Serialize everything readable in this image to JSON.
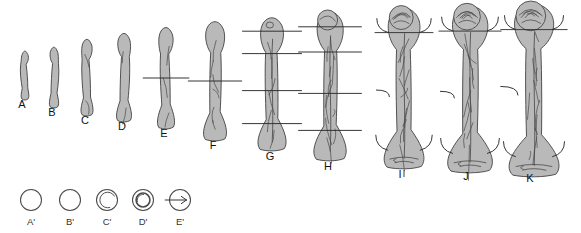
{
  "figure": {
    "background_color": "#ffffff",
    "bone_fill": "#b9b9b9",
    "bone_stroke": "#4a4a4a",
    "marker_stroke": "#2b2b2b",
    "label_color": "#111111"
  },
  "top_row": {
    "name": "maturation-series",
    "stages": [
      {
        "id": "A",
        "label": "A",
        "cx": 25,
        "label_x": 22,
        "label_y": 108,
        "top": 52,
        "bottom": 99,
        "width": 9,
        "features": "slender straight diaphysis, no markers",
        "markers": 0,
        "epiphysis": "none",
        "vascular": "none"
      },
      {
        "id": "B",
        "label": "B",
        "cx": 54,
        "label_x": 52,
        "label_y": 116,
        "top": 48,
        "bottom": 107,
        "width": 10,
        "features": "slightly longer straight shaft",
        "markers": 0,
        "epiphysis": "none",
        "vascular": "none"
      },
      {
        "id": "C",
        "label": "C",
        "cx": 87,
        "label_x": 85,
        "label_y": 124,
        "top": 40,
        "bottom": 115,
        "width": 12,
        "features": "flaring metaphyses, faint mid-shaft cortical lines",
        "markers": 0,
        "epiphysis": "none",
        "vascular": "faint"
      },
      {
        "id": "D",
        "label": "D",
        "cx": 124,
        "label_x": 122,
        "label_y": 130,
        "top": 34,
        "bottom": 121,
        "width": 14,
        "features": "broader flared ends, mid-shaft cortical outline",
        "markers": 0,
        "epiphysis": "none",
        "vascular": "faint"
      },
      {
        "id": "E",
        "label": "E",
        "cx": 166,
        "label_x": 164,
        "label_y": 137,
        "top": 28,
        "bottom": 128,
        "width": 15,
        "features": "single mid-shaft transverse marker",
        "markers": 1,
        "epiphysis": "none",
        "vascular": "light"
      },
      {
        "id": "F",
        "label": "F",
        "cx": 215,
        "label_x": 213,
        "label_y": 149,
        "top": 22,
        "bottom": 140,
        "width": 19,
        "features": "expanded distal end, mid-shaft marker",
        "markers": 1,
        "epiphysis": "none",
        "vascular": "moderate"
      },
      {
        "id": "G",
        "label": "G",
        "cx": 272,
        "label_x": 270,
        "label_y": 160,
        "top": 18,
        "bottom": 150,
        "width": 22,
        "features": "four transverse markers, trabecular lines",
        "markers": 4,
        "epiphysis": "forming",
        "vascular": "moderate"
      },
      {
        "id": "H",
        "label": "H",
        "cx": 330,
        "label_x": 328,
        "label_y": 170,
        "top": 12,
        "bottom": 160,
        "width": 24,
        "features": "rounded proximal epiphyseal centre, four markers",
        "markers": 4,
        "epiphysis": "ossifying-head",
        "vascular": "dense"
      },
      {
        "id": "I",
        "label": "I",
        "cx": 404,
        "label_x": 400,
        "label_y": 178,
        "top": 8,
        "bottom": 168,
        "width": 28,
        "features": "curved bracket markers at both ends, articulated head",
        "markers": 4,
        "epiphysis": "mature-head",
        "vascular": "dense"
      },
      {
        "id": "J",
        "label": "J",
        "cx": 470,
        "label_x": 466,
        "label_y": 180,
        "top": 6,
        "bottom": 172,
        "width": 30,
        "features": "fully formed head and expanded distal condyles",
        "markers": 4,
        "epiphysis": "fusing",
        "vascular": "dense"
      },
      {
        "id": "K",
        "label": "K",
        "cx": 534,
        "label_x": 530,
        "label_y": 182,
        "top": 4,
        "bottom": 176,
        "width": 32,
        "features": "adult morphology, epiphyses fused",
        "markers": 3,
        "epiphysis": "fused",
        "vascular": "dense"
      }
    ]
  },
  "bottom_row": {
    "name": "cross-section-series",
    "label_y": 225,
    "center_y": 200,
    "sections": [
      {
        "id": "A'",
        "label": "A'",
        "cx": 31,
        "r": 10.5,
        "inner": "none",
        "description": "plain cortical ring, no medullary cavity"
      },
      {
        "id": "B'",
        "label": "B'",
        "cx": 70,
        "r": 10.5,
        "inner": "none",
        "description": "plain ring, slightly thicker cortex"
      },
      {
        "id": "C'",
        "label": "C'",
        "cx": 107,
        "r": 10.5,
        "inner": "crescent",
        "description": "early medullary crescent appears"
      },
      {
        "id": "D'",
        "label": "D'",
        "cx": 143,
        "r": 10.5,
        "inner": "thick-ring",
        "description": "defined medullary cavity within thick cortex"
      },
      {
        "id": "E'",
        "label": "E'",
        "cx": 180,
        "r": 10.5,
        "inner": "arrow-through",
        "description": "cavity with transverse nutrient-canal arrow"
      }
    ]
  }
}
